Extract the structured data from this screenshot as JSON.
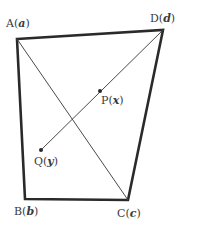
{
  "diagram": {
    "type": "quadrilateral",
    "colors": {
      "stroke": "#2a2a2a",
      "thin_stroke": "#4a4a4a",
      "text": "#3a3a3a",
      "background": "#ffffff"
    },
    "vertices": {
      "A": {
        "name": "A",
        "var": "a",
        "x": 17,
        "y": 39
      },
      "B": {
        "name": "B",
        "var": "b",
        "x": 25,
        "y": 199
      },
      "C": {
        "name": "C",
        "var": "c",
        "x": 128,
        "y": 200
      },
      "D": {
        "name": "D",
        "var": "d",
        "x": 163,
        "y": 30
      }
    },
    "points": {
      "P": {
        "name": "P",
        "var": "x",
        "x": 100,
        "y": 91
      },
      "Q": {
        "name": "Q",
        "var": "y",
        "x": 41,
        "y": 150
      }
    },
    "edges": [
      [
        "A",
        "D"
      ],
      [
        "D",
        "C"
      ],
      [
        "C",
        "B"
      ],
      [
        "B",
        "A"
      ]
    ],
    "segments": [
      [
        "A",
        "C"
      ],
      [
        "D",
        "Q"
      ]
    ]
  }
}
